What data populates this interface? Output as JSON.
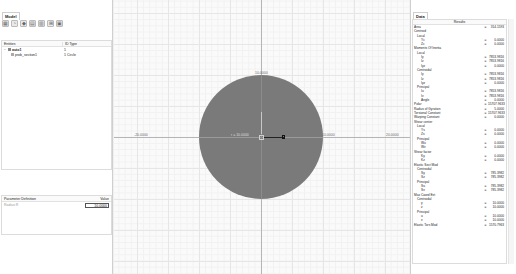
{
  "left_panel": {
    "tab_label": "Model",
    "toolbar": [
      {
        "name": "new-section-icon",
        "glyph": "▦"
      },
      {
        "name": "add-shape-icon",
        "glyph": "◔"
      },
      {
        "name": "delete-icon",
        "glyph": "◆"
      },
      {
        "name": "properties-icon",
        "glyph": "▤"
      },
      {
        "name": "copy-icon",
        "glyph": "▥"
      },
      {
        "name": "mesh-icon",
        "glyph": "⊞"
      },
      {
        "name": "export-icon",
        "glyph": "▣"
      }
    ],
    "tree": {
      "col_entities": "Entities",
      "col_id_type": "ID Type",
      "rows": [
        {
          "name": "auto1",
          "id_type": "1",
          "level": 0
        },
        {
          "name": "prob_section1",
          "id_type": "1 Circle",
          "level": 1
        }
      ]
    },
    "params": {
      "col_definition": "Parameter Definition",
      "col_value": "Value",
      "rows": [
        {
          "name": "Radius R",
          "value": "10.0000"
        }
      ]
    }
  },
  "viewport": {
    "labels": {
      "top": "10.0000",
      "right": "10.0000",
      "radius": "r = 10.0000",
      "axis_left": "-20.0000",
      "axis_right": "20.0000"
    },
    "shape_color": "#7a7a7a"
  },
  "right_panel": {
    "tab_label": "Data",
    "results_header": "Results",
    "rows": [
      {
        "label": "Area",
        "value": "314.1593",
        "indent": 0
      },
      {
        "label": "Centroid",
        "value": "",
        "indent": 0
      },
      {
        "label": "Local",
        "value": "",
        "indent": 1
      },
      {
        "label": "Yc",
        "value": "0.0000",
        "indent": 2
      },
      {
        "label": "Zc",
        "value": "0.0000",
        "indent": 2
      },
      {
        "label": "Moments Of Inertia",
        "value": "",
        "indent": 0
      },
      {
        "label": "Local",
        "value": "",
        "indent": 1
      },
      {
        "label": "Iy",
        "value": "7853.9816",
        "indent": 2
      },
      {
        "label": "Iz",
        "value": "7853.9816",
        "indent": 2
      },
      {
        "label": "Iyz",
        "value": "0.0000",
        "indent": 2
      },
      {
        "label": "Centroidal",
        "value": "",
        "indent": 1
      },
      {
        "label": "Iy",
        "value": "7853.9816",
        "indent": 2
      },
      {
        "label": "Iz",
        "value": "7853.9816",
        "indent": 2
      },
      {
        "label": "Iyz",
        "value": "0.0000",
        "indent": 2
      },
      {
        "label": "Principal",
        "value": "",
        "indent": 1
      },
      {
        "label": "Iu",
        "value": "7853.9816",
        "indent": 2
      },
      {
        "label": "Iv",
        "value": "7853.9816",
        "indent": 2
      },
      {
        "label": "Angle",
        "value": "0.0000",
        "indent": 2
      },
      {
        "label": "Polar",
        "value": "15707.9633",
        "indent": 0
      },
      {
        "label": "Radius of Gyration",
        "value": "5.0000",
        "indent": 0
      },
      {
        "label": "Torsional Constant",
        "value": "15707.9633",
        "indent": 0
      },
      {
        "label": "Warping Constant",
        "value": "0.0000",
        "indent": 0
      },
      {
        "label": "Shear center",
        "value": "",
        "indent": 0
      },
      {
        "label": "Local",
        "value": "",
        "indent": 1
      },
      {
        "label": "Ys",
        "value": "0.0000",
        "indent": 2
      },
      {
        "label": "Zs",
        "value": "0.0000",
        "indent": 2
      },
      {
        "label": "Principal",
        "value": "",
        "indent": 1
      },
      {
        "label": "Wu",
        "value": "0.0000",
        "indent": 2
      },
      {
        "label": "Wv",
        "value": "0.0000",
        "indent": 2
      },
      {
        "label": "Shear factor",
        "value": "",
        "indent": 0
      },
      {
        "label": "Ky",
        "value": "0.0000",
        "indent": 2
      },
      {
        "label": "Kz",
        "value": "0.0000",
        "indent": 2
      },
      {
        "label": "Elastic Sect Mod",
        "value": "",
        "indent": 0
      },
      {
        "label": "Centroidal",
        "value": "",
        "indent": 1
      },
      {
        "label": "Sy",
        "value": "785.3982",
        "indent": 2
      },
      {
        "label": "Sz",
        "value": "785.3982",
        "indent": 2
      },
      {
        "label": "Principal",
        "value": "",
        "indent": 1
      },
      {
        "label": "Su",
        "value": "785.3982",
        "indent": 2
      },
      {
        "label": "Sv",
        "value": "785.3982",
        "indent": 2
      },
      {
        "label": "Max Coord Ext",
        "value": "",
        "indent": 0
      },
      {
        "label": "Centroidal",
        "value": "",
        "indent": 1
      },
      {
        "label": "y",
        "value": "10.0000",
        "indent": 2
      },
      {
        "label": "z",
        "value": "10.0000",
        "indent": 2
      },
      {
        "label": "Principal",
        "value": "",
        "indent": 1
      },
      {
        "label": "u",
        "value": "10.0000",
        "indent": 2
      },
      {
        "label": "v",
        "value": "10.0000",
        "indent": 2
      },
      {
        "label": "Elastic Tors Mod",
        "value": "1570.7963",
        "indent": 0
      }
    ]
  }
}
